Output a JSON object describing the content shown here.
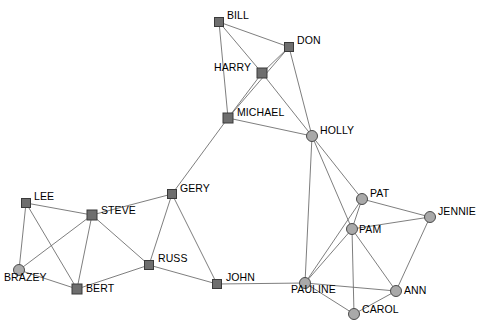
{
  "graph": {
    "title": "Social Network Graph",
    "node_shapes": {
      "square": "square-node",
      "circle": "circle-node"
    },
    "colors": {
      "square_fill": "#6e6e6e",
      "square_stroke": "#3a3a3a",
      "circle_fill": "#a9a9a9",
      "circle_stroke": "#4a4a4a",
      "edge": "#6f6f6f",
      "label": "#000000",
      "background": "#ffffff"
    },
    "nodes": [
      {
        "id": "BILL",
        "label": "BILL",
        "x": 219,
        "y": 22,
        "shape": "square",
        "size": 9,
        "label_dx": 8,
        "label_dy": -6
      },
      {
        "id": "DON",
        "label": "DON",
        "x": 289,
        "y": 47,
        "shape": "square",
        "size": 9,
        "label_dx": 8,
        "label_dy": -6
      },
      {
        "id": "HARRY",
        "label": "HARRY",
        "x": 262,
        "y": 73,
        "shape": "square",
        "size": 10,
        "label_dx": -48,
        "label_dy": -5
      },
      {
        "id": "MICHAEL",
        "label": "MICHAEL",
        "x": 228,
        "y": 118,
        "shape": "square",
        "size": 10,
        "label_dx": 9,
        "label_dy": -5
      },
      {
        "id": "HOLLY",
        "label": "HOLLY",
        "x": 312,
        "y": 136,
        "shape": "circle",
        "size": 8,
        "label_dx": 8,
        "label_dy": -5
      },
      {
        "id": "GERY",
        "label": "GERY",
        "x": 172,
        "y": 194,
        "shape": "square",
        "size": 9,
        "label_dx": 8,
        "label_dy": -5
      },
      {
        "id": "PAT",
        "label": "PAT",
        "x": 362,
        "y": 199,
        "shape": "circle",
        "size": 8,
        "label_dx": 8,
        "label_dy": -5
      },
      {
        "id": "LEE",
        "label": "LEE",
        "x": 26,
        "y": 203,
        "shape": "square",
        "size": 9,
        "label_dx": 8,
        "label_dy": -6
      },
      {
        "id": "STEVE",
        "label": "STEVE",
        "x": 92,
        "y": 215,
        "shape": "square",
        "size": 10,
        "label_dx": 9,
        "label_dy": -4
      },
      {
        "id": "JENNIE",
        "label": "JENNIE",
        "x": 430,
        "y": 217,
        "shape": "circle",
        "size": 8,
        "label_dx": 8,
        "label_dy": -5
      },
      {
        "id": "PAM",
        "label": "PAM",
        "x": 352,
        "y": 229,
        "shape": "circle",
        "size": 8,
        "label_dx": 7,
        "label_dy": 1
      },
      {
        "id": "RUSS",
        "label": "RUSS",
        "x": 149,
        "y": 265,
        "shape": "square",
        "size": 9,
        "label_dx": 9,
        "label_dy": -6
      },
      {
        "id": "BRAZEY",
        "label": "BRAZEY",
        "x": 19,
        "y": 270,
        "shape": "circle",
        "size": 8,
        "label_dx": -15,
        "label_dy": 8
      },
      {
        "id": "JOHN",
        "label": "JOHN",
        "x": 217,
        "y": 284,
        "shape": "square",
        "size": 9,
        "label_dx": 9,
        "label_dy": -6
      },
      {
        "id": "PAULINE",
        "label": "PAULINE",
        "x": 305,
        "y": 283,
        "shape": "circle",
        "size": 8,
        "label_dx": -14,
        "label_dy": 7
      },
      {
        "id": "BERT",
        "label": "BERT",
        "x": 77,
        "y": 289,
        "shape": "square",
        "size": 10,
        "label_dx": 9,
        "label_dy": 0
      },
      {
        "id": "ANN",
        "label": "ANN",
        "x": 396,
        "y": 291,
        "shape": "circle",
        "size": 8,
        "label_dx": 8,
        "label_dy": 0
      },
      {
        "id": "CAROL",
        "label": "CAROL",
        "x": 354,
        "y": 314,
        "shape": "circle",
        "size": 8,
        "label_dx": 8,
        "label_dy": -4
      }
    ],
    "edges": [
      {
        "from": "BILL",
        "to": "DON"
      },
      {
        "from": "BILL",
        "to": "HARRY"
      },
      {
        "from": "BILL",
        "to": "MICHAEL"
      },
      {
        "from": "DON",
        "to": "HARRY"
      },
      {
        "from": "DON",
        "to": "MICHAEL"
      },
      {
        "from": "DON",
        "to": "HOLLY"
      },
      {
        "from": "HARRY",
        "to": "MICHAEL"
      },
      {
        "from": "HARRY",
        "to": "HOLLY"
      },
      {
        "from": "MICHAEL",
        "to": "HOLLY"
      },
      {
        "from": "MICHAEL",
        "to": "GERY"
      },
      {
        "from": "HOLLY",
        "to": "PAT"
      },
      {
        "from": "HOLLY",
        "to": "PAM"
      },
      {
        "from": "HOLLY",
        "to": "PAULINE"
      },
      {
        "from": "GERY",
        "to": "STEVE"
      },
      {
        "from": "GERY",
        "to": "RUSS"
      },
      {
        "from": "GERY",
        "to": "JOHN"
      },
      {
        "from": "PAT",
        "to": "PAM"
      },
      {
        "from": "PAT",
        "to": "JENNIE"
      },
      {
        "from": "PAT",
        "to": "PAULINE"
      },
      {
        "from": "LEE",
        "to": "STEVE"
      },
      {
        "from": "LEE",
        "to": "BRAZEY"
      },
      {
        "from": "LEE",
        "to": "BERT"
      },
      {
        "from": "STEVE",
        "to": "BRAZEY"
      },
      {
        "from": "STEVE",
        "to": "BERT"
      },
      {
        "from": "STEVE",
        "to": "RUSS"
      },
      {
        "from": "JENNIE",
        "to": "PAM"
      },
      {
        "from": "JENNIE",
        "to": "ANN"
      },
      {
        "from": "PAM",
        "to": "PAULINE"
      },
      {
        "from": "PAM",
        "to": "ANN"
      },
      {
        "from": "PAM",
        "to": "CAROL"
      },
      {
        "from": "RUSS",
        "to": "BERT"
      },
      {
        "from": "RUSS",
        "to": "JOHN"
      },
      {
        "from": "BRAZEY",
        "to": "BERT"
      },
      {
        "from": "JOHN",
        "to": "PAULINE"
      },
      {
        "from": "PAULINE",
        "to": "ANN"
      },
      {
        "from": "PAULINE",
        "to": "CAROL"
      },
      {
        "from": "ANN",
        "to": "CAROL"
      }
    ]
  }
}
